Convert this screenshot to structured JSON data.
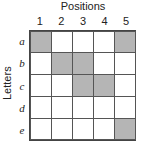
{
  "title": "Positions",
  "y_label": "Letters",
  "columns": [
    "1",
    "2",
    "3",
    "4",
    "5"
  ],
  "rows": [
    "a",
    "b",
    "c",
    "d",
    "e"
  ],
  "shaded": [
    [
      1,
      0,
      0,
      0,
      1
    ],
    [
      0,
      1,
      1,
      0,
      0
    ],
    [
      0,
      0,
      1,
      1,
      0
    ],
    [
      0,
      0,
      0,
      0,
      0
    ],
    [
      0,
      0,
      0,
      0,
      1
    ]
  ],
  "colors": {
    "shaded": "#b5b5b5",
    "empty": "#ffffff",
    "border": "#555555"
  }
}
